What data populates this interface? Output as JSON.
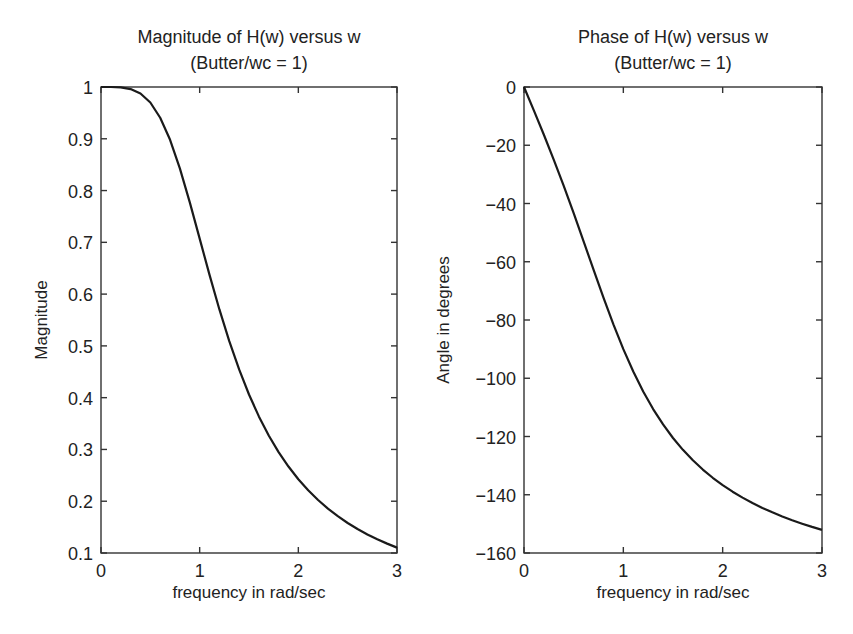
{
  "chart_data": [
    {
      "type": "line",
      "title": "Magnitude of H(w) versus w",
      "subtitle": "(Butter/wc = 1)",
      "xlabel": "frequency in rad/sec",
      "ylabel": "Magnitude",
      "xlim": [
        0,
        3
      ],
      "ylim": [
        0.1,
        1
      ],
      "xticks": [
        0,
        1,
        2,
        3
      ],
      "xtick_labels": [
        "0",
        "1",
        "2",
        "3"
      ],
      "yticks": [
        0.1,
        0.2,
        0.3,
        0.4,
        0.5,
        0.6,
        0.7,
        0.8,
        0.9,
        1
      ],
      "ytick_labels": [
        "0.1",
        "0.2",
        "0.3",
        "0.4",
        "0.5",
        "0.6",
        "0.7",
        "0.8",
        "0.9",
        "1"
      ],
      "grid": false,
      "legend": null,
      "series": [
        {
          "name": "|H(w)|",
          "color": "#1a1a1a",
          "x": [
            0,
            0.1,
            0.2,
            0.3,
            0.4,
            0.5,
            0.6,
            0.7,
            0.8,
            0.9,
            1.0,
            1.1,
            1.2,
            1.3,
            1.4,
            1.5,
            1.6,
            1.7,
            1.8,
            1.9,
            2.0,
            2.1,
            2.2,
            2.3,
            2.4,
            2.5,
            2.6,
            2.7,
            2.8,
            2.9,
            3.0
          ],
          "values": [
            1.0,
            1.0,
            0.9992,
            0.996,
            0.9874,
            0.9701,
            0.9406,
            0.898,
            0.8423,
            0.7771,
            0.7071,
            0.6371,
            0.5704,
            0.5092,
            0.4545,
            0.4061,
            0.3638,
            0.327,
            0.2949,
            0.267,
            0.2425,
            0.2211,
            0.2023,
            0.1857,
            0.1711,
            0.158,
            0.1463,
            0.1359,
            0.1265,
            0.1181,
            0.1104
          ]
        }
      ]
    },
    {
      "type": "line",
      "title": "Phase of H(w) versus w",
      "subtitle": "(Butter/wc = 1)",
      "xlabel": "frequency in rad/sec",
      "ylabel": "Angle in degrees",
      "xlim": [
        0,
        3
      ],
      "ylim": [
        -160,
        0
      ],
      "xticks": [
        0,
        1,
        2,
        3
      ],
      "xtick_labels": [
        "0",
        "1",
        "2",
        "3"
      ],
      "yticks": [
        -160,
        -140,
        -120,
        -100,
        -80,
        -60,
        -40,
        -20,
        0
      ],
      "ytick_labels": [
        "−160",
        "−140",
        "−120",
        "−100",
        "−80",
        "−60",
        "−40",
        "−20",
        "0"
      ],
      "grid": false,
      "legend": null,
      "series": [
        {
          "name": "angle H(w)",
          "color": "#1a1a1a",
          "x": [
            0,
            0.1,
            0.2,
            0.3,
            0.4,
            0.5,
            0.6,
            0.7,
            0.8,
            0.9,
            1.0,
            1.1,
            1.2,
            1.3,
            1.4,
            1.5,
            1.6,
            1.7,
            1.8,
            1.9,
            2.0,
            2.1,
            2.2,
            2.3,
            2.4,
            2.5,
            2.6,
            2.7,
            2.8,
            2.9,
            3.0
          ],
          "values": [
            0,
            -8.13,
            -16.41,
            -25.0,
            -33.96,
            -43.31,
            -52.97,
            -62.74,
            -72.35,
            -81.51,
            -90.0,
            -97.69,
            -104.53,
            -110.57,
            -115.87,
            -120.51,
            -124.58,
            -128.17,
            -131.34,
            -134.17,
            -136.69,
            -138.95,
            -140.98,
            -142.83,
            -144.51,
            -146.04,
            -147.45,
            -148.74,
            -149.93,
            -151.04,
            -152.06
          ]
        }
      ]
    }
  ],
  "layout": {
    "panels": [
      {
        "left": 101,
        "top": 87,
        "right": 397,
        "bottom": 553,
        "title_x": 249
      },
      {
        "left": 524,
        "top": 87,
        "right": 822,
        "bottom": 553,
        "title_x": 673
      }
    ]
  }
}
